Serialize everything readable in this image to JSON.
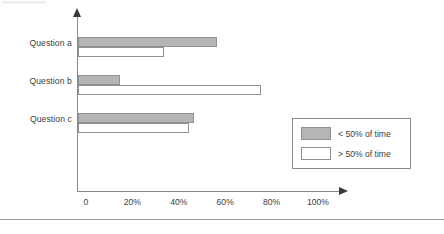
{
  "chart_data": {
    "type": "bar",
    "orientation": "horizontal",
    "title": "",
    "xlabel": "",
    "ylabel": "",
    "categories": [
      "Question a",
      "Question b",
      "Question c"
    ],
    "series": [
      {
        "name": "< 50% of time",
        "key": "low",
        "color": "#b5b5b5",
        "values": [
          60,
          18,
          50
        ]
      },
      {
        "name": "> 50% of time",
        "key": "high",
        "color": "#ffffff",
        "values": [
          37,
          79,
          48
        ]
      }
    ],
    "xlim": [
      0,
      100
    ],
    "xticks": [
      0,
      20,
      40,
      60,
      80,
      100
    ],
    "xtick_labels": [
      "0",
      "20%",
      "40%",
      "60%",
      "80%",
      "100%"
    ],
    "grid": false,
    "legend_position": "lower-right",
    "axis_arrows": true
  },
  "legend": {
    "items": [
      {
        "label": "< 50% of time",
        "swatch": "low"
      },
      {
        "label": "> 50% of time",
        "swatch": "high"
      }
    ]
  }
}
